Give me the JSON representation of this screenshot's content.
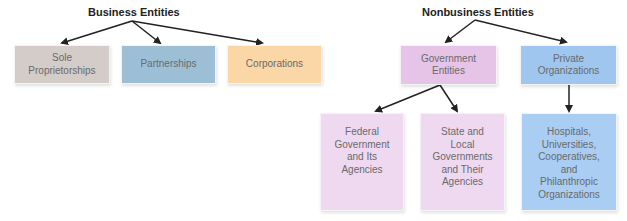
{
  "business": {
    "title": "Business Entities",
    "children": [
      {
        "label": "Sole\nProprietorships",
        "color": "#d4ccc8"
      },
      {
        "label": "Partnerships",
        "color": "#9cbfd6"
      },
      {
        "label": "Corporations",
        "color": "#fbd6a6"
      }
    ]
  },
  "nonbusiness": {
    "title": "Nonbusiness Entities",
    "children": [
      {
        "label": "Government\nEntities",
        "color": "#e5c4e8",
        "children": [
          {
            "label": "Federal\nGovernment\nand Its\nAgencies",
            "color": "#efd9f1"
          },
          {
            "label": "State and\nLocal\nGovernments\nand Their\nAgencies",
            "color": "#efd9f1"
          }
        ]
      },
      {
        "label": "Private\nOrganizations",
        "color": "#9ec6ef",
        "children": [
          {
            "label": "Hospitals,\nUniversities,\nCooperatives,\nand\nPhilanthropic\nOrganizations",
            "color": "#a9cdf3"
          }
        ]
      }
    ]
  },
  "colors": {
    "arrow": "#222222",
    "text": "#6a6a6a"
  }
}
